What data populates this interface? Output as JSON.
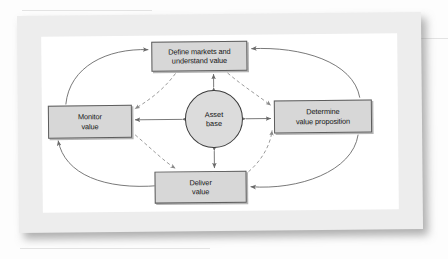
{
  "document": {
    "type": "scanned-book-page",
    "background_color": "#fdfdfd",
    "paper_color": "#ededed",
    "inner_page_color": "#ffffff"
  },
  "diagram": {
    "center": {
      "id": "asset-base",
      "label": "Asset\nbase",
      "shape": "circle",
      "fill": "#dcdcdc",
      "stroke": "#3c3c3c"
    },
    "nodes": [
      {
        "id": "define-markets",
        "label": "Define markets and\nunderstand value",
        "position": "top",
        "fill": "#d7d7d7",
        "stroke": "#5d5d5d"
      },
      {
        "id": "determine-value",
        "label": "Determine\nvalue proposition",
        "position": "right",
        "fill": "#d7d7d7",
        "stroke": "#5d5d5d"
      },
      {
        "id": "deliver-value",
        "label": "Deliver\nvalue",
        "position": "bottom",
        "fill": "#d7d7d7",
        "stroke": "#5d5d5d"
      },
      {
        "id": "monitor-value",
        "label": "Monitor\nvalue",
        "position": "left",
        "fill": "#d7d7d7",
        "stroke": "#5d5d5d"
      }
    ],
    "radial_connectors": [
      {
        "from": "asset-base",
        "to": "define-markets",
        "style": "solid",
        "arrows": "both",
        "orientation": "vertical"
      },
      {
        "from": "asset-base",
        "to": "determine-value",
        "style": "solid",
        "arrows": "both",
        "orientation": "horizontal"
      },
      {
        "from": "asset-base",
        "to": "deliver-value",
        "style": "solid",
        "arrows": "both",
        "orientation": "vertical"
      },
      {
        "from": "asset-base",
        "to": "monitor-value",
        "style": "solid",
        "arrows": "both",
        "orientation": "horizontal"
      }
    ],
    "outer_cycle": [
      {
        "from": "monitor-value",
        "to": "define-markets",
        "style": "solid",
        "arrows": "forward"
      },
      {
        "from": "determine-value",
        "to": "define-markets",
        "style": "solid",
        "arrows": "forward"
      },
      {
        "from": "determine-value",
        "to": "deliver-value",
        "style": "solid",
        "arrows": "forward"
      },
      {
        "from": "deliver-value",
        "to": "monitor-value",
        "style": "solid",
        "arrows": "forward"
      }
    ],
    "inner_dashed": [
      {
        "from": "define-markets",
        "to": "monitor-value",
        "style": "dashed",
        "arrows": "forward"
      },
      {
        "from": "define-markets",
        "to": "determine-value",
        "style": "dashed",
        "arrows": "forward"
      },
      {
        "from": "monitor-value",
        "to": "deliver-value",
        "style": "dashed",
        "arrows": "forward"
      },
      {
        "from": "deliver-value",
        "to": "determine-value",
        "style": "dashed",
        "arrows": "forward"
      }
    ],
    "line_color": "#6a6a6a",
    "dashed_color": "#8a8a8a"
  }
}
